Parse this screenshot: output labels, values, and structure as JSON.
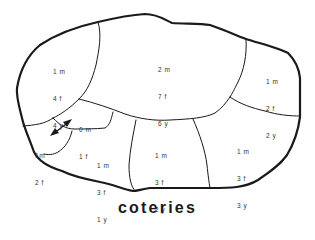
{
  "title": "coteries",
  "coteries": [
    {
      "id": "top-left",
      "m": "1 m",
      "f": "4 f",
      "y": "4 y"
    },
    {
      "id": "top-center",
      "m": "2 m",
      "f": "7 f",
      "y": "6 y"
    },
    {
      "id": "top-right",
      "m": "1 m",
      "f": "2 f",
      "y": "2 y"
    },
    {
      "id": "small-center",
      "m": "0 m",
      "f": "1 f",
      "y": ""
    },
    {
      "id": "small-left",
      "m": "1m",
      "f": "2 f",
      "y": ""
    },
    {
      "id": "bottom-left",
      "m": "1 m",
      "f": "3 f",
      "y": "1 y"
    },
    {
      "id": "bottom-center",
      "m": "1 m",
      "f": "3 f",
      "y": "2 y"
    },
    {
      "id": "bottom-right",
      "m": "1 m",
      "f": "3 f",
      "y": "3 y"
    }
  ],
  "arrow": {
    "type": "double-headed",
    "between": [
      "small-left",
      "small-center"
    ]
  },
  "colors": {
    "line": "#1a1a1a",
    "text": "#333333",
    "background": "#ffffff"
  }
}
